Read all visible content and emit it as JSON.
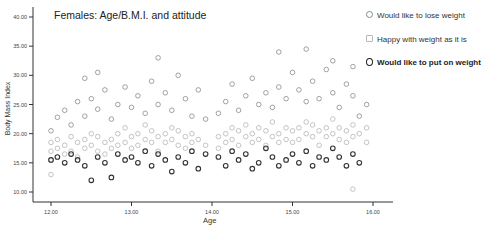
{
  "chart_data": {
    "type": "scatter",
    "title": "Females: Age/B.M.I. and attitude",
    "xlabel": "Age",
    "ylabel": "Body Mass Index",
    "xlim": [
      11.65,
      16.35
    ],
    "ylim": [
      9,
      41.5
    ],
    "xticks": [
      12.0,
      13.0,
      14.0,
      15.0,
      16.0
    ],
    "xtick_labels": [
      "12.00",
      "13.00",
      "14.00",
      "15.00",
      "16.00"
    ],
    "yticks": [
      10.0,
      15.0,
      20.0,
      25.0,
      30.0,
      35.0,
      40.0
    ],
    "ytick_labels": [
      "10.00",
      "15.00",
      "20.00",
      "25.00",
      "30.00",
      "35.00",
      "40.00"
    ],
    "grid": false,
    "legend_position": "upper right (outside plot)",
    "series": [
      {
        "name": "Would like to lose weight",
        "color": "#8a8a8a",
        "marker": "circle",
        "points": [
          [
            12.0,
            20.5
          ],
          [
            12.08,
            22.8
          ],
          [
            12.17,
            24.0
          ],
          [
            12.25,
            21.5
          ],
          [
            12.33,
            25.5
          ],
          [
            12.42,
            23.0
          ],
          [
            12.5,
            26.0
          ],
          [
            12.58,
            24.2
          ],
          [
            12.67,
            27.5
          ],
          [
            12.75,
            22.5
          ],
          [
            12.83,
            25.0
          ],
          [
            12.92,
            28.0
          ],
          [
            13.0,
            24.5
          ],
          [
            13.08,
            26.5
          ],
          [
            13.17,
            23.5
          ],
          [
            13.25,
            29.0
          ],
          [
            13.33,
            25.0
          ],
          [
            13.42,
            27.0
          ],
          [
            13.5,
            24.0
          ],
          [
            13.58,
            30.0
          ],
          [
            13.67,
            26.0
          ],
          [
            13.75,
            23.0
          ],
          [
            13.83,
            27.5
          ],
          [
            13.92,
            22.5
          ],
          [
            14.08,
            23.5
          ],
          [
            14.17,
            25.5
          ],
          [
            14.25,
            28.5
          ],
          [
            14.33,
            24.0
          ],
          [
            14.42,
            26.5
          ],
          [
            14.5,
            29.5
          ],
          [
            14.58,
            25.0
          ],
          [
            14.67,
            27.0
          ],
          [
            14.75,
            24.5
          ],
          [
            14.83,
            28.0
          ],
          [
            14.92,
            26.0
          ],
          [
            15.0,
            30.5
          ],
          [
            15.08,
            27.5
          ],
          [
            15.17,
            25.5
          ],
          [
            15.25,
            29.0
          ],
          [
            15.33,
            26.0
          ],
          [
            15.42,
            31.0
          ],
          [
            15.5,
            27.0
          ],
          [
            15.58,
            24.5
          ],
          [
            15.67,
            28.5
          ],
          [
            15.75,
            26.5
          ],
          [
            15.83,
            23.0
          ],
          [
            15.92,
            25.0
          ],
          [
            12.42,
            29.5
          ],
          [
            12.58,
            30.5
          ],
          [
            13.33,
            33.0
          ],
          [
            14.83,
            34.0
          ],
          [
            15.17,
            34.5
          ],
          [
            15.5,
            32.5
          ],
          [
            15.75,
            31.5
          ]
        ]
      },
      {
        "name": "Happy with weight as it is",
        "color": "#b8b8b8",
        "marker": "circle",
        "points": [
          [
            12.0,
            17.0
          ],
          [
            12.0,
            18.5
          ],
          [
            12.0,
            15.5
          ],
          [
            12.0,
            13.0
          ],
          [
            12.08,
            19.0
          ],
          [
            12.08,
            17.5
          ],
          [
            12.17,
            18.0
          ],
          [
            12.17,
            16.5
          ],
          [
            12.25,
            19.5
          ],
          [
            12.25,
            17.0
          ],
          [
            12.33,
            18.5
          ],
          [
            12.33,
            16.0
          ],
          [
            12.42,
            19.0
          ],
          [
            12.42,
            17.5
          ],
          [
            12.5,
            18.0
          ],
          [
            12.5,
            20.0
          ],
          [
            12.58,
            17.0
          ],
          [
            12.58,
            19.5
          ],
          [
            12.67,
            18.5
          ],
          [
            12.67,
            16.5
          ],
          [
            12.75,
            19.0
          ],
          [
            12.75,
            17.5
          ],
          [
            12.83,
            20.0
          ],
          [
            12.83,
            18.0
          ],
          [
            12.92,
            18.5
          ],
          [
            12.92,
            21.0
          ],
          [
            13.0,
            19.5
          ],
          [
            13.0,
            17.5
          ],
          [
            13.08,
            20.0
          ],
          [
            13.08,
            18.0
          ],
          [
            13.17,
            19.0
          ],
          [
            13.17,
            21.5
          ],
          [
            13.25,
            18.5
          ],
          [
            13.25,
            20.5
          ],
          [
            13.33,
            19.5
          ],
          [
            13.33,
            17.0
          ],
          [
            13.42,
            20.0
          ],
          [
            13.42,
            18.5
          ],
          [
            13.5,
            19.0
          ],
          [
            13.5,
            21.0
          ],
          [
            13.58,
            18.0
          ],
          [
            13.58,
            20.5
          ],
          [
            13.67,
            19.5
          ],
          [
            13.67,
            17.5
          ],
          [
            13.75,
            20.0
          ],
          [
            13.75,
            18.5
          ],
          [
            13.83,
            19.0
          ],
          [
            13.92,
            18.0
          ],
          [
            14.08,
            19.5
          ],
          [
            14.08,
            17.5
          ],
          [
            14.17,
            20.0
          ],
          [
            14.17,
            18.5
          ],
          [
            14.25,
            19.0
          ],
          [
            14.25,
            21.0
          ],
          [
            14.33,
            20.5
          ],
          [
            14.33,
            18.0
          ],
          [
            14.42,
            19.5
          ],
          [
            14.42,
            21.5
          ],
          [
            14.5,
            20.0
          ],
          [
            14.5,
            18.5
          ],
          [
            14.58,
            19.0
          ],
          [
            14.58,
            21.0
          ],
          [
            14.67,
            20.5
          ],
          [
            14.67,
            18.0
          ],
          [
            14.75,
            19.5
          ],
          [
            14.75,
            22.0
          ],
          [
            14.83,
            20.0
          ],
          [
            14.83,
            18.5
          ],
          [
            14.92,
            21.0
          ],
          [
            14.92,
            19.0
          ],
          [
            15.0,
            20.5
          ],
          [
            15.0,
            18.5
          ],
          [
            15.08,
            21.0
          ],
          [
            15.08,
            19.0
          ],
          [
            15.17,
            20.0
          ],
          [
            15.17,
            22.0
          ],
          [
            15.25,
            19.5
          ],
          [
            15.25,
            21.5
          ],
          [
            15.33,
            20.5
          ],
          [
            15.33,
            18.0
          ],
          [
            15.42,
            21.0
          ],
          [
            15.42,
            19.5
          ],
          [
            15.5,
            20.0
          ],
          [
            15.5,
            22.5
          ],
          [
            15.58,
            19.0
          ],
          [
            15.58,
            21.0
          ],
          [
            15.67,
            20.5
          ],
          [
            15.67,
            18.5
          ],
          [
            15.75,
            21.5
          ],
          [
            15.75,
            19.5
          ],
          [
            15.83,
            20.0
          ],
          [
            15.92,
            21.0
          ],
          [
            15.92,
            18.5
          ],
          [
            15.75,
            10.5
          ]
        ]
      },
      {
        "name": "Would like to put on weight",
        "color": "#222222",
        "marker": "circle-bold",
        "points": [
          [
            12.0,
            15.5
          ],
          [
            12.08,
            16.0
          ],
          [
            12.17,
            15.0
          ],
          [
            12.25,
            16.5
          ],
          [
            12.33,
            15.5
          ],
          [
            12.42,
            14.5
          ],
          [
            12.5,
            12.0
          ],
          [
            12.58,
            16.0
          ],
          [
            12.67,
            15.0
          ],
          [
            12.75,
            12.5
          ],
          [
            12.83,
            16.5
          ],
          [
            12.92,
            15.5
          ],
          [
            13.0,
            16.0
          ],
          [
            13.08,
            15.0
          ],
          [
            13.17,
            17.0
          ],
          [
            13.25,
            14.5
          ],
          [
            13.33,
            16.5
          ],
          [
            13.42,
            15.5
          ],
          [
            13.5,
            13.5
          ],
          [
            13.58,
            16.0
          ],
          [
            13.67,
            15.0
          ],
          [
            13.75,
            17.0
          ],
          [
            13.83,
            14.0
          ],
          [
            13.92,
            16.5
          ],
          [
            14.08,
            16.0
          ],
          [
            14.17,
            14.5
          ],
          [
            14.25,
            17.0
          ],
          [
            14.33,
            15.5
          ],
          [
            14.42,
            16.5
          ],
          [
            14.5,
            14.0
          ],
          [
            14.58,
            15.0
          ],
          [
            14.67,
            17.5
          ],
          [
            14.75,
            16.0
          ],
          [
            14.83,
            14.5
          ],
          [
            14.92,
            15.5
          ],
          [
            15.0,
            16.5
          ],
          [
            15.08,
            15.0
          ],
          [
            15.17,
            17.0
          ],
          [
            15.25,
            14.5
          ],
          [
            15.33,
            16.0
          ],
          [
            15.42,
            15.5
          ],
          [
            15.5,
            17.5
          ],
          [
            15.58,
            16.0
          ],
          [
            15.67,
            14.5
          ],
          [
            15.75,
            16.5
          ],
          [
            15.83,
            15.0
          ]
        ]
      }
    ]
  },
  "legend": {
    "items": [
      {
        "label": "Would like to lose weight"
      },
      {
        "label": "Happy with weight as it is"
      },
      {
        "label": "Would like to put on weight"
      }
    ]
  }
}
